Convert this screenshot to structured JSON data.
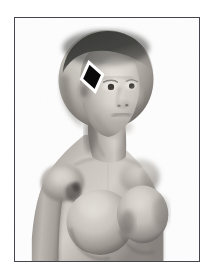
{
  "image": {
    "kind": "anatomical-3d-render",
    "subject": "female head and bust, three-quarter view, bald",
    "rendering": "grayscale shaded 3D model on white background",
    "alt_text": "Grayscale 3D rendered female figure shown from the waist up in three-quarter view with a black diamond marker on the upper left side of the head"
  },
  "frame": {
    "border_color": "#45454c",
    "background_color": "#fdfdfd",
    "x": 14,
    "y": 17,
    "width": 186,
    "height": 245
  },
  "figure": {
    "skin_light": "#d8d4cf",
    "skin_mid": "#a9a49f",
    "skin_shadow": "#6f6a66",
    "skin_deep_shadow": "#4a4642",
    "scalp_cap": "#3a3a38",
    "background": "#fdfdfd"
  },
  "marker": {
    "label": "diamond-marker",
    "shape": "diamond",
    "fill_color": "#0a0a0a",
    "outline_color": "#ffffff",
    "center_x": 78,
    "center_y": 64,
    "width": 22,
    "height": 30,
    "rotation_deg": -12,
    "location_description": "upper left side of the head"
  }
}
